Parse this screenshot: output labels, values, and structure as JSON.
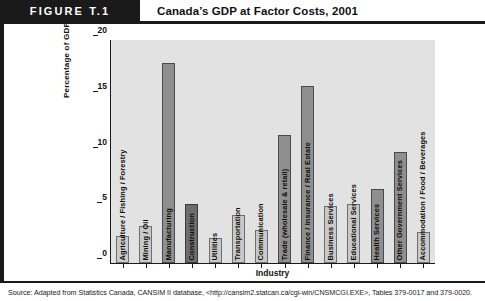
{
  "header": {
    "tag": "FIGURE T.1",
    "title": "Canada’s GDP at Factor Costs, 2001"
  },
  "source_note": "Source: Adapted from Statistics Canada, CANSIM II database, <http://cansim2.statcan.ca/cgi-win/CNSMCGI.EXE>, Tables 379-0017 and 379-0020.",
  "colors": {
    "header_bar": "#1a1a1a",
    "plot_background": "#e2e2e2",
    "bar_medium": "#8f8f8f",
    "bar_light": "#c9c9c9",
    "bar_dark": "#6d6d6d",
    "axis": "#1a1a1a"
  },
  "chart_data": {
    "type": "bar",
    "title": "Canada’s GDP at Factor Costs, 2001",
    "xlabel": "Industry",
    "ylabel": "Percentage of GDP",
    "ylim": [
      0,
      20
    ],
    "yticks": [
      "0",
      "5",
      "10",
      "15",
      "20"
    ],
    "grid": false,
    "legend": "none",
    "categories": [
      "Agriculture / Fishing / Forestry",
      "Mining / Oil",
      "Manufacturing",
      "Construction",
      "Utilities",
      "Transportation",
      "Communication",
      "Trade (wholesale & retail)",
      "Finance / Insurance / Real Estate",
      "Business Services",
      "Educational Services",
      "Health Services",
      "Other Government Services",
      "Accommodation / Food / Beverages"
    ],
    "values": [
      2.4,
      3.3,
      17.9,
      5.3,
      2.2,
      4.3,
      3.0,
      11.5,
      15.9,
      5.1,
      5.3,
      6.6,
      10.0,
      2.8
    ],
    "bar_shades": [
      "light",
      "light",
      "medium",
      "dark",
      "light",
      "light",
      "light",
      "medium",
      "medium",
      "light",
      "light",
      "medium",
      "medium",
      "light"
    ]
  }
}
